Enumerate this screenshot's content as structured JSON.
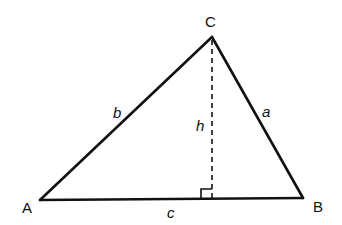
{
  "diagram": {
    "type": "triangle-with-altitude",
    "vertices": {
      "A": {
        "label": "A",
        "x": 40,
        "y": 200
      },
      "B": {
        "label": "B",
        "x": 303,
        "y": 198
      },
      "C": {
        "label": "C",
        "x": 212,
        "y": 37
      }
    },
    "sides": {
      "a": {
        "label": "a",
        "from": "B",
        "to": "C"
      },
      "b": {
        "label": "b",
        "from": "A",
        "to": "C"
      },
      "c": {
        "label": "c",
        "from": "A",
        "to": "B"
      }
    },
    "altitude": {
      "label": "h",
      "from": "C",
      "foot_x": 212,
      "foot_y": 199,
      "style": "dashed"
    },
    "right_angle_marker": true,
    "stroke_color": "#111111"
  }
}
